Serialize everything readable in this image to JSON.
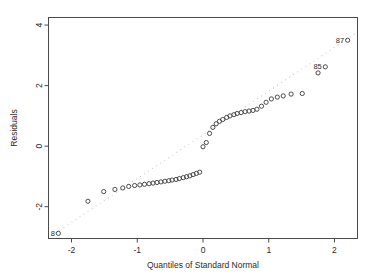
{
  "chart_data": {
    "type": "scatter",
    "title": "",
    "xlabel": "Quantiles of Standard Normal",
    "ylabel": "Residuals",
    "xlim": [
      -2.35,
      2.35
    ],
    "ylim": [
      -3.05,
      4.25
    ],
    "xticks": [
      -2,
      -1,
      0,
      1,
      2
    ],
    "xticklabels": [
      "-2",
      "-1",
      "0",
      "1",
      "2"
    ],
    "yticks": [
      -2,
      0,
      2,
      4
    ],
    "yticklabels": [
      "-2",
      "0",
      "2",
      "4"
    ],
    "grid": false,
    "legend": null,
    "marker": "open-circle",
    "series": [
      {
        "name": "Residuals vs normal quantiles",
        "x": [
          -2.2,
          -1.75,
          -1.51,
          -1.34,
          -1.22,
          -1.13,
          -1.04,
          -0.96,
          -0.89,
          -0.82,
          -0.76,
          -0.7,
          -0.64,
          -0.58,
          -0.52,
          -0.47,
          -0.41,
          -0.36,
          -0.3,
          -0.25,
          -0.2,
          -0.15,
          -0.1,
          -0.05,
          0.0,
          0.05,
          0.1,
          0.15,
          0.2,
          0.25,
          0.3,
          0.36,
          0.41,
          0.47,
          0.52,
          0.58,
          0.64,
          0.7,
          0.76,
          0.82,
          0.89,
          0.96,
          1.04,
          1.13,
          1.22,
          1.34,
          1.51,
          1.75,
          1.86,
          2.2
        ],
        "y": [
          -2.88,
          -1.82,
          -1.5,
          -1.43,
          -1.38,
          -1.33,
          -1.3,
          -1.28,
          -1.26,
          -1.24,
          -1.22,
          -1.2,
          -1.18,
          -1.16,
          -1.14,
          -1.12,
          -1.1,
          -1.07,
          -1.04,
          -1.01,
          -0.98,
          -0.94,
          -0.9,
          -0.86,
          -0.02,
          0.12,
          0.42,
          0.62,
          0.74,
          0.82,
          0.88,
          0.95,
          1.0,
          1.04,
          1.08,
          1.11,
          1.14,
          1.16,
          1.18,
          1.22,
          1.32,
          1.45,
          1.56,
          1.62,
          1.66,
          1.72,
          1.74,
          2.42,
          2.62,
          3.5
        ]
      }
    ],
    "reference_line": {
      "style": "dotted",
      "x1": -2.3,
      "y1": -2.95,
      "x2": 2.3,
      "y2": 3.7
    },
    "point_labels": [
      {
        "text": "87",
        "x": 2.2,
        "y": 3.5,
        "anchor": "right"
      },
      {
        "text": "85",
        "x": 1.86,
        "y": 2.62,
        "anchor": "right"
      },
      {
        "text": "8",
        "x": -2.2,
        "y": -2.88,
        "anchor": "right"
      }
    ]
  }
}
